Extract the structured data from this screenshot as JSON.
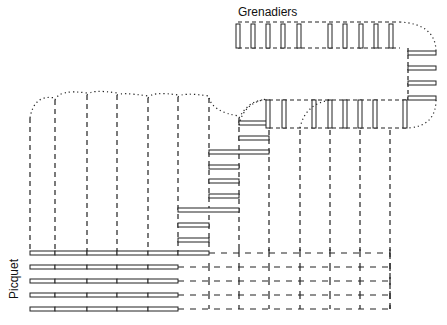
{
  "labels": {
    "grenadiers": "Grenadiers",
    "picquet": "Picquet"
  },
  "colors": {
    "ink": "#222222",
    "background": "#ffffff"
  },
  "columns_x": [
    30,
    55,
    87,
    117,
    148,
    178,
    209,
    239,
    269,
    300,
    330,
    360,
    390
  ],
  "picquet_rows_y": [
    253,
    267,
    281,
    295,
    309
  ],
  "grenadier_top_bars_x": [
    238,
    253,
    268,
    283,
    299,
    330,
    345,
    361,
    376,
    391
  ],
  "grenadier_mid_bars_x": [
    268,
    284,
    314,
    330,
    345,
    360,
    375,
    405
  ],
  "grenadier_right_bars_y": [
    53,
    68,
    83,
    98
  ],
  "stair_bars": [
    {
      "x1": 239,
      "x2": 269,
      "y": 123
    },
    {
      "x1": 239,
      "x2": 269,
      "y": 138
    },
    {
      "x1": 209,
      "x2": 269,
      "y": 152
    },
    {
      "x1": 209,
      "x2": 239,
      "y": 167
    },
    {
      "x1": 209,
      "x2": 239,
      "y": 181
    },
    {
      "x1": 209,
      "x2": 239,
      "y": 196
    },
    {
      "x1": 178,
      "x2": 239,
      "y": 210
    },
    {
      "x1": 178,
      "x2": 209,
      "y": 225
    },
    {
      "x1": 178,
      "x2": 209,
      "y": 240
    }
  ]
}
